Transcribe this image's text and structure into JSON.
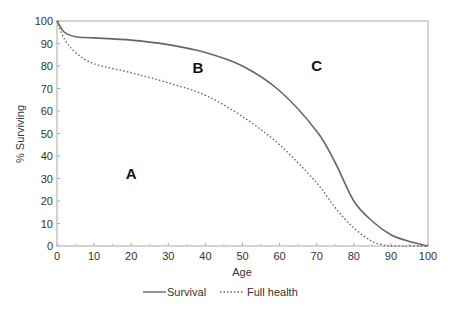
{
  "chart_data": {
    "type": "line",
    "title": "",
    "xlabel": "Age",
    "ylabel": "% Surviving",
    "xlim": [
      0,
      100
    ],
    "ylim": [
      0,
      100
    ],
    "x_ticks": [
      0,
      10,
      20,
      30,
      40,
      50,
      60,
      70,
      80,
      90,
      100
    ],
    "y_ticks": [
      0,
      10,
      20,
      30,
      40,
      50,
      60,
      70,
      80,
      90,
      100
    ],
    "grid": false,
    "legend_position": "bottom",
    "series": [
      {
        "name": "Survival",
        "style": "solid",
        "color": "#666666",
        "x": [
          0,
          2,
          5,
          10,
          20,
          30,
          40,
          50,
          60,
          70,
          75,
          80,
          85,
          90,
          95,
          100
        ],
        "values": [
          100,
          95,
          93,
          92.5,
          91.5,
          89.5,
          86,
          80,
          69,
          51,
          37,
          20,
          11,
          5,
          2,
          0
        ]
      },
      {
        "name": "Full health",
        "style": "dotted",
        "color": "#666666",
        "x": [
          0,
          2,
          5,
          10,
          20,
          30,
          40,
          50,
          60,
          70,
          75,
          80,
          85,
          88,
          90,
          100
        ],
        "values": [
          100,
          92,
          86,
          81,
          77,
          72.5,
          67,
          57.5,
          45,
          28,
          17,
          8,
          2,
          0.5,
          0,
          0
        ]
      }
    ],
    "annotations": [
      {
        "text": "A",
        "x": 20,
        "y": 30
      },
      {
        "text": "B",
        "x": 38,
        "y": 77
      },
      {
        "text": "C",
        "x": 70,
        "y": 78
      }
    ]
  },
  "labels": {
    "xlabel": "Age",
    "ylabel": "% Surviving",
    "legend_survival": "Survival",
    "legend_full_health": "Full health",
    "region_a": "A",
    "region_b": "B",
    "region_c": "C"
  }
}
